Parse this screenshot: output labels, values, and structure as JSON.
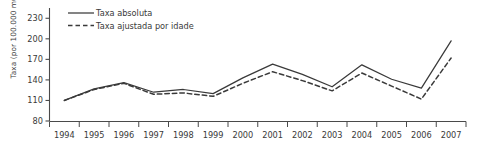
{
  "chart_data": {
    "type": "line",
    "title": "",
    "xlabel": "",
    "ylabel": "Taxa (por 100.000 mulheres)",
    "categories": [
      "1994",
      "1995",
      "1996",
      "1997",
      "1998",
      "1999",
      "2000",
      "2001",
      "2002",
      "2003",
      "2004",
      "2005",
      "2006",
      "2007"
    ],
    "yticks": [
      80,
      110,
      140,
      170,
      200,
      230
    ],
    "ylim": [
      80,
      245
    ],
    "grid": false,
    "legend_position": "top-left",
    "series": [
      {
        "name": "Taxa absoluta",
        "style": "solid",
        "color": "#3a3a3a",
        "values": [
          110,
          127,
          136,
          122,
          126,
          120,
          143,
          163,
          148,
          130,
          162,
          141,
          128,
          197
        ]
      },
      {
        "name": "Taxa ajustada por idade",
        "style": "dashed",
        "color": "#3a3a3a",
        "values": [
          110,
          126,
          135,
          119,
          121,
          116,
          135,
          152,
          139,
          124,
          150,
          131,
          112,
          172
        ]
      }
    ]
  },
  "axis": {
    "y_title": "Taxa (por 100.000 mulheres)"
  },
  "legend": {
    "items": [
      {
        "label": "Taxa absoluta",
        "style": "solid"
      },
      {
        "label": "Taxa ajustada por idade",
        "style": "dashed"
      }
    ]
  }
}
